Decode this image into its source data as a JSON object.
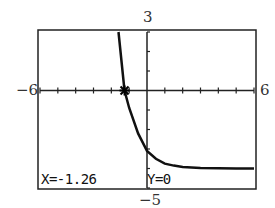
{
  "chart_data": {
    "type": "line",
    "title": "",
    "xlabel": "",
    "ylabel": "",
    "window": {
      "xmin": -6,
      "xmax": 6,
      "ymin": -5,
      "ymax": 3,
      "xscl": 1,
      "yscl": 1
    },
    "tick_labels": {
      "xmin": "−6",
      "xmax": "6",
      "ymin": "−5",
      "ymax": "3"
    },
    "grid": false,
    "series": [
      {
        "name": "y",
        "description": "decreasing exponential curve approaching horizontal asymptote near y = -4",
        "x": [
          -1.6,
          -1.26,
          -1.0,
          -0.5,
          0.0,
          0.5,
          1.0,
          1.5,
          2.0,
          3.0,
          4.0,
          5.0,
          6.0
        ],
        "values": [
          3.0,
          0.0,
          -0.9,
          -2.2,
          -3.1,
          -3.5,
          -3.75,
          -3.85,
          -3.92,
          -3.97,
          -3.99,
          -4.0,
          -4.0
        ]
      }
    ],
    "trace_point": {
      "x": -1.26,
      "y": 0
    }
  },
  "status": {
    "x_readout": "X=-1.26",
    "y_readout": "Y=0"
  }
}
